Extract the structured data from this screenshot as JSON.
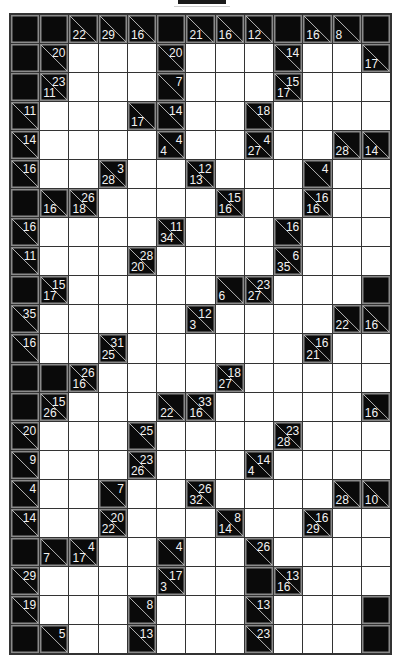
{
  "puzzle": {
    "type": "kakuro",
    "columns": 13,
    "rows": 22,
    "legend": "Cell codes: B = solid block, W = empty entry cell, clue cells give {d: down-sum, r: right-sum}",
    "grid": [
      [
        "B",
        "B",
        {
          "d": 22
        },
        {
          "d": 29
        },
        {
          "d": 16
        },
        "B",
        {
          "d": 21
        },
        {
          "d": 16
        },
        {
          "d": 12
        },
        "B",
        {
          "d": 16
        },
        {
          "d": 8
        },
        "B"
      ],
      [
        "B",
        {
          "r": 20
        },
        "W",
        "W",
        "W",
        {
          "r": 20
        },
        "W",
        "W",
        "W",
        {
          "r": 14
        },
        "W",
        "W",
        {
          "d": 17
        }
      ],
      [
        "B",
        {
          "d": 11,
          "r": 23
        },
        "W",
        "W",
        "W",
        {
          "r": 7
        },
        "W",
        "W",
        "W",
        {
          "d": 17,
          "r": 15
        },
        "W",
        "W",
        "W"
      ],
      [
        {
          "r": 11
        },
        "W",
        "W",
        "W",
        {
          "d": 17
        },
        {
          "r": 14
        },
        "W",
        "W",
        {
          "r": 18
        },
        "W",
        "W",
        "W",
        "W"
      ],
      [
        {
          "r": 14
        },
        "W",
        "W",
        "W",
        "W",
        {
          "d": 4,
          "r": 4
        },
        "W",
        "W",
        {
          "d": 27,
          "r": 4
        },
        "W",
        "W",
        {
          "d": 28
        },
        {
          "d": 14
        }
      ],
      [
        {
          "r": 16
        },
        "W",
        "W",
        {
          "d": 28,
          "r": 3
        },
        "W",
        "W",
        {
          "d": 13,
          "r": 12
        },
        "W",
        "W",
        "W",
        {
          "r": 4
        },
        "W",
        "W"
      ],
      [
        "B",
        {
          "d": 16
        },
        {
          "d": 18,
          "r": 26
        },
        "W",
        "W",
        "W",
        "W",
        {
          "d": 16,
          "r": 15
        },
        "W",
        "W",
        {
          "d": 16,
          "r": 16
        },
        "W",
        "W"
      ],
      [
        {
          "r": 16
        },
        "W",
        "W",
        "W",
        "W",
        {
          "d": 34,
          "r": 11
        },
        "W",
        "W",
        "W",
        {
          "r": 16
        },
        "W",
        "W",
        "W"
      ],
      [
        {
          "r": 11
        },
        "W",
        "W",
        "W",
        {
          "d": 20,
          "r": 28
        },
        "W",
        "W",
        "W",
        "W",
        {
          "d": 35,
          "r": 6
        },
        "W",
        "W",
        "W"
      ],
      [
        "B",
        {
          "d": 17,
          "r": 15
        },
        "W",
        "W",
        "W",
        "W",
        "W",
        {
          "d": 6
        },
        {
          "d": 27,
          "r": 23
        },
        "W",
        "W",
        "W",
        "B"
      ],
      [
        {
          "r": 35
        },
        "W",
        "W",
        "W",
        "W",
        "W",
        {
          "d": 3,
          "r": 12
        },
        "W",
        "W",
        "W",
        "W",
        {
          "d": 22
        },
        {
          "d": 16
        }
      ],
      [
        {
          "r": 16
        },
        "W",
        "W",
        {
          "d": 25,
          "r": 31
        },
        "W",
        "W",
        "W",
        "W",
        "W",
        "W",
        {
          "d": 21,
          "r": 16
        },
        "W",
        "W"
      ],
      [
        "B",
        "B",
        {
          "d": 16,
          "r": 26
        },
        "W",
        "W",
        "W",
        "W",
        {
          "d": 27,
          "r": 18
        },
        "W",
        "W",
        "W",
        "W",
        "W"
      ],
      [
        "B",
        {
          "d": 26,
          "r": 15
        },
        "W",
        "W",
        "W",
        {
          "d": 22
        },
        {
          "d": 16,
          "r": 33
        },
        "W",
        "W",
        "W",
        "W",
        "W",
        {
          "d": 16
        }
      ],
      [
        {
          "r": 20
        },
        "W",
        "W",
        "W",
        {
          "r": 25
        },
        "W",
        "W",
        "W",
        "W",
        {
          "d": 28,
          "r": 23
        },
        "W",
        "W",
        "W"
      ],
      [
        {
          "r": 9
        },
        "W",
        "W",
        "W",
        {
          "d": 26,
          "r": 23
        },
        "W",
        "W",
        "W",
        {
          "d": 4,
          "r": 14
        },
        "W",
        "W",
        "W",
        "W"
      ],
      [
        {
          "r": 4
        },
        "W",
        "W",
        {
          "r": 7
        },
        "W",
        "W",
        {
          "d": 32,
          "r": 26
        },
        "W",
        "W",
        "W",
        "W",
        {
          "d": 28
        },
        {
          "d": 10
        }
      ],
      [
        {
          "r": 14
        },
        "W",
        "W",
        {
          "d": 22,
          "r": 20
        },
        "W",
        "W",
        "W",
        {
          "d": 14,
          "r": 8
        },
        "W",
        "W",
        {
          "d": 29,
          "r": 16
        },
        "W",
        "W"
      ],
      [
        "B",
        {
          "d": 7
        },
        {
          "d": 17,
          "r": 4
        },
        "W",
        "W",
        {
          "r": 4
        },
        "W",
        "W",
        {
          "r": 26
        },
        "W",
        "W",
        "W",
        "W"
      ],
      [
        {
          "r": 29
        },
        "W",
        "W",
        "W",
        "W",
        {
          "d": 3,
          "r": 17
        },
        "W",
        "W",
        "B",
        {
          "d": 16,
          "r": 13
        },
        "W",
        "W",
        "W"
      ],
      [
        {
          "r": 19
        },
        "W",
        "W",
        "W",
        {
          "r": 8
        },
        "W",
        "W",
        "W",
        {
          "r": 13
        },
        "W",
        "W",
        "W",
        "B"
      ],
      [
        "B",
        {
          "r": 5
        },
        "W",
        "W",
        {
          "r": 13
        },
        "W",
        "W",
        "W",
        {
          "r": 23
        },
        "W",
        "W",
        "W",
        "B"
      ]
    ]
  }
}
